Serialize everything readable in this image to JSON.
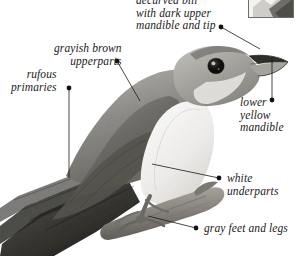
{
  "page": {
    "width": 296,
    "height": 256,
    "background": "#ffffff",
    "ink": "#1b1b1b"
  },
  "body_copy": {
    "line1": "ry",
    "line2": "ow.”"
  },
  "inset": {
    "name": "range-map-thumbnail"
  },
  "annotations": [
    {
      "id": "bill",
      "lines": [
        "decurved bill",
        "with dark upper",
        "mandible and tip"
      ],
      "text": "decurved bill with dark upper mandible and tip",
      "align": "left",
      "x": 136,
      "y": -6,
      "dot": {
        "x": 221,
        "y": 27
      },
      "leader": {
        "x1": 221,
        "y1": 27,
        "x2": 260,
        "y2": 49
      }
    },
    {
      "id": "upperparts",
      "lines": [
        "grayish brown",
        "upperparts"
      ],
      "text": "grayish brown upperparts",
      "align": "right",
      "x": 54,
      "y": 42,
      "dot": {
        "x": 117,
        "y": 61
      },
      "leader": {
        "x1": 117,
        "y1": 61,
        "x2": 140,
        "y2": 101
      }
    },
    {
      "id": "primaries",
      "lines": [
        "rufous",
        "primaries"
      ],
      "text": "rufous primaries",
      "align": "right",
      "x": 11,
      "y": 68,
      "dot": {
        "x": 69,
        "y": 88
      },
      "leader": {
        "x1": 69,
        "y1": 88,
        "x2": 69,
        "y2": 178
      }
    },
    {
      "id": "mandible",
      "lines": [
        "lower",
        "yellow",
        "mandible"
      ],
      "text": "lower yellow mandible",
      "align": "left",
      "x": 240,
      "y": 96,
      "dot": {
        "x": 272,
        "y": 100
      },
      "leader": {
        "x1": 272,
        "y1": 100,
        "x2": 272,
        "y2": 57
      }
    },
    {
      "id": "underparts",
      "lines": [
        "white",
        "underparts"
      ],
      "text": "white underparts",
      "align": "left",
      "x": 227,
      "y": 172,
      "dot": {
        "x": 219,
        "y": 178
      },
      "leader": {
        "x1": 219,
        "y1": 178,
        "x2": 152,
        "y2": 164
      }
    },
    {
      "id": "feet",
      "lines": [
        "gray feet and legs"
      ],
      "text": "gray feet and legs",
      "align": "left",
      "x": 204,
      "y": 222,
      "dot": {
        "x": 196,
        "y": 228
      },
      "leader": {
        "x1": 196,
        "y1": 228,
        "x2": 148,
        "y2": 216
      }
    }
  ],
  "subject": {
    "name": "yellow-billed-cuckoo-photograph",
    "description": "grayscale photograph of a cuckoo perched on a branch"
  }
}
